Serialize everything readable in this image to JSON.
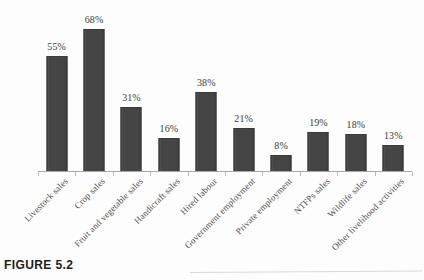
{
  "figure": {
    "caption": "FIGURE 5.2"
  },
  "chart_data": {
    "type": "bar",
    "title": "",
    "subtitle": "",
    "xlabel": "",
    "ylabel": "",
    "ylim": [
      0,
      75
    ],
    "grid": false,
    "legend": null,
    "value_suffix": "%",
    "categories": [
      "Livestock sales",
      "Crop sales",
      "Fruit and vegetable sales",
      "Handicraft sales",
      "Hired labour",
      "Government employment",
      "Private employment",
      "NTFPs sales",
      "Wildlife sales",
      "Other livelihood activities"
    ],
    "values": [
      55,
      68,
      31,
      16,
      38,
      21,
      8,
      19,
      18,
      13
    ],
    "value_labels": [
      "55%",
      "68%",
      "31%",
      "16%",
      "38%",
      "21%",
      "8%",
      "19%",
      "18%",
      "13%"
    ],
    "bar_color": "#454545",
    "bar_edge_color": "#3b3b3b",
    "axis_color": "#a8a8a8",
    "background": "#fdfdfd"
  }
}
